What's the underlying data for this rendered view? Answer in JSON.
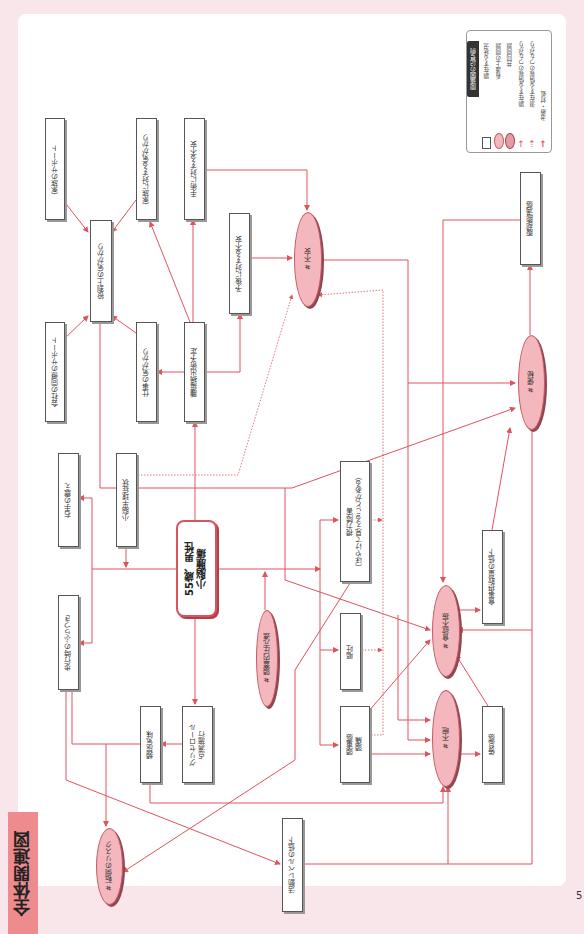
{
  "title": "全体関連図",
  "page_number": "5",
  "legend": {
    "title": "関連図の記号例",
    "items": [
      {
        "symbol": "rectangle",
        "label": "顕在する状況"
      },
      {
        "symbol": "ellipse",
        "label": "看護上の問題"
      },
      {
        "symbol": "ellipse-dark",
        "label": "共同問題"
      },
      {
        "symbol": "solid-arrow",
        "label": "顕在する情報のつながり"
      },
      {
        "symbol": "dotted-arrow",
        "label": "潜在する情報のつながり"
      },
      {
        "symbol": "thick-arrow",
        "label": "治療・対処"
      }
    ]
  },
  "center": {
    "line1": "55歳、男性",
    "line2": "小脳腫瘍"
  },
  "nodes": {
    "family_support": "家族のサポート",
    "role_worry": "役割上の気がかり",
    "coworker_support": "会社の同僚のサポート",
    "family_worry": "家族に対する気がかり",
    "work_worry": "仕事の気がかり",
    "surgery_anxiety": "手術に対する不安",
    "surgery_planned": "腫瘍摘出術予定",
    "prognosis_anxiety": "予後に対する不安",
    "abdominal_distension": "腹部膨満感",
    "right_hand_tremor": "右手の震え",
    "cerebellar_symptoms": "小脳半球症状",
    "gait_unsteadiness": "歩行時のふらつき",
    "visual_impairment_1": "視力障害",
    "visual_impairment_2": "（ぼやけて見えることがある）",
    "vomiting": "嘔吐",
    "headache_1": "頭重感",
    "headache_2": "頭痛",
    "food_intake_decrease": "食事摂取量の低下",
    "fatigue": "倦怠感",
    "urinary_urgency": "頻尿気味",
    "glycerol_1": "グリセロール",
    "glycerol_2": "点滴施行",
    "activity_decrease": "活動レベルの低下"
  },
  "problems": {
    "anxiety": "#  不安",
    "constipation": "#  便秘",
    "icp": "#  頭蓋内圧亢進",
    "anorexia": "#  食欲不振",
    "insomnia": "#  不眠",
    "fall_risk": "#  転倒のリスク"
  },
  "colors": {
    "line": "#e0525c",
    "problem_fill": "#f3b7bd",
    "tag": "#ee8b8e",
    "page_bg": "#f8e6ea"
  }
}
